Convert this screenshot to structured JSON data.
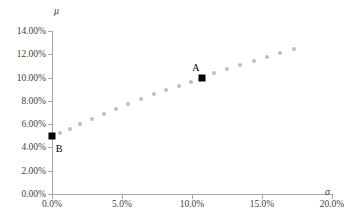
{
  "chart_data": {
    "type": "scatter",
    "title": "",
    "xlabel": "σ",
    "ylabel": "μ",
    "xlim": [
      0,
      0.2
    ],
    "ylim": [
      0,
      0.14
    ],
    "grid": false,
    "legend": null,
    "x_ticks": [
      {
        "value": 0.0,
        "label": "0.0%"
      },
      {
        "value": 0.05,
        "label": "5.0%"
      },
      {
        "value": 0.1,
        "label": "10.0%"
      },
      {
        "value": 0.15,
        "label": "15.0%"
      },
      {
        "value": 0.2,
        "label": "20.0%"
      }
    ],
    "y_ticks": [
      {
        "value": 0.0,
        "label": "0.00%"
      },
      {
        "value": 0.02,
        "label": "2.00%"
      },
      {
        "value": 0.04,
        "label": "4.00%"
      },
      {
        "value": 0.06,
        "label": "6.00%"
      },
      {
        "value": 0.08,
        "label": "8.00%"
      },
      {
        "value": 0.1,
        "label": "10.00%"
      },
      {
        "value": 0.12,
        "label": "12.00%"
      },
      {
        "value": 0.14,
        "label": "14.00%"
      }
    ],
    "series": [
      {
        "name": "frontier-points",
        "marker": "circle",
        "color": "#bfbfbf",
        "points": [
          {
            "x": 0.0055,
            "y": 0.0525
          },
          {
            "x": 0.0125,
            "y": 0.056
          },
          {
            "x": 0.02,
            "y": 0.06
          },
          {
            "x": 0.0285,
            "y": 0.0645
          },
          {
            "x": 0.037,
            "y": 0.069
          },
          {
            "x": 0.0455,
            "y": 0.073
          },
          {
            "x": 0.0545,
            "y": 0.0775
          },
          {
            "x": 0.0635,
            "y": 0.0815
          },
          {
            "x": 0.0725,
            "y": 0.0855
          },
          {
            "x": 0.0815,
            "y": 0.0895
          },
          {
            "x": 0.0905,
            "y": 0.093
          },
          {
            "x": 0.0995,
            "y": 0.0965
          },
          {
            "x": 0.116,
            "y": 0.1035
          },
          {
            "x": 0.125,
            "y": 0.107
          },
          {
            "x": 0.1345,
            "y": 0.1105
          },
          {
            "x": 0.144,
            "y": 0.114
          },
          {
            "x": 0.1535,
            "y": 0.1175
          },
          {
            "x": 0.163,
            "y": 0.121
          },
          {
            "x": 0.1725,
            "y": 0.1245
          }
        ]
      },
      {
        "name": "labeled-portfolios",
        "marker": "square",
        "color": "#000000",
        "points": [
          {
            "x": 0.107,
            "y": 0.1,
            "label": "A",
            "label_dx": -6,
            "label_dy": -11
          },
          {
            "x": 0.0,
            "y": 0.05,
            "label": "B",
            "label_dx": 7,
            "label_dy": 12
          }
        ]
      }
    ]
  }
}
